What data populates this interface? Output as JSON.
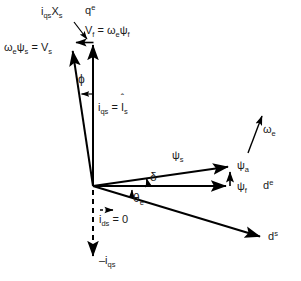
{
  "figure": {
    "type": "phasor-vector-diagram",
    "title": "",
    "background_color": "#ffffff",
    "line_color": "#000000",
    "text_color": "#1a1a1a",
    "width": 301,
    "height": 281
  },
  "labels": {
    "iqs_xs": "i",
    "iqs_xs_sub1": "qs",
    "iqs_xs_main2": "X",
    "iqs_xs_sub2": "s",
    "qe_axis": "q",
    "qe_axis_sup": "e",
    "vf_pre": "V",
    "vf_sub": "f",
    "vf_eq": " = ",
    "vf_omega": "ω",
    "vf_omega_sub": "e",
    "vf_psi": "ψ",
    "vf_psi_sub": "f",
    "vs_omega": "ω",
    "vs_omega_sub": "e",
    "vs_psi": "ψ",
    "vs_psi_sub": "s",
    "vs_eq": " = V",
    "vs_sub": "s",
    "phi": "ϕ",
    "iqs_eq_pre": "i",
    "iqs_eq_sub": "qs",
    "iqs_eq_mid": " = ",
    "iqs_eq_I": "I",
    "iqs_eq_I_sub": "s",
    "iqs_eq_hat": "ˆ",
    "omega_e": "ω",
    "omega_e_sub": "e",
    "psi_s": "ψ",
    "psi_s_sub": "s",
    "psi_a": "ψ",
    "psi_a_sub": "a",
    "psi_f": "ψ",
    "psi_f_sub": "f",
    "de_axis": "d",
    "de_axis_sup": "e",
    "delta": "δ",
    "theta_e": "θ",
    "theta_e_sub": "e",
    "ids_pre": "i",
    "ids_sub": "ds",
    "ids_eq": " = 0",
    "neg_iqs_pre": "–i",
    "neg_iqs_sub": "qs",
    "ds_axis": "d",
    "ds_axis_sup": "s"
  },
  "geometry": {
    "origin": {
      "x": 93,
      "y": 186
    },
    "vectors": [
      {
        "name": "qe-axis-vertical",
        "x1": 93,
        "y1": 186,
        "x2": 93,
        "y2": 42,
        "arrow": true
      },
      {
        "name": "vs-vector",
        "x1": 93,
        "y1": 186,
        "x2": 72,
        "y2": 48,
        "arrow": true
      },
      {
        "name": "iqs-xs-component",
        "x1": 93,
        "y1": 42,
        "x2": 73,
        "y2": 42,
        "arrow": true
      },
      {
        "name": "psi-s-vector",
        "x1": 93,
        "y1": 186,
        "x2": 231,
        "y2": 166,
        "arrow": true
      },
      {
        "name": "psi-f-vector",
        "x1": 93,
        "y1": 186,
        "x2": 229,
        "y2": 186,
        "arrow": true
      },
      {
        "name": "psi-a-vector",
        "x1": 230,
        "y1": 186,
        "x2": 230,
        "y2": 169,
        "arrow": true
      },
      {
        "name": "ds-axis",
        "x1": 93,
        "y1": 186,
        "x2": 265,
        "y2": 238,
        "arrow": true
      },
      {
        "name": "neg-iqs-dashed-axis",
        "x1": 93,
        "y1": 189,
        "x2": 93,
        "y2": 262,
        "arrow": true,
        "dashed": true
      },
      {
        "name": "omega-e-arrow",
        "x1": 247,
        "y1": 152,
        "x2": 263,
        "y2": 112,
        "arrow": true
      },
      {
        "name": "ids-zero-arrow",
        "x1": 101,
        "y1": 210,
        "x2": 117,
        "y2": 210,
        "arrow": true,
        "dashed": true
      }
    ],
    "angles": [
      {
        "name": "phi",
        "label": "ϕ",
        "vertex": "between Vs vector and qe axis"
      },
      {
        "name": "delta",
        "label": "δ",
        "vertex": "between psi_s and psi_f"
      },
      {
        "name": "theta_e",
        "label": "θe",
        "vertex": "between psi_f and ds axis"
      }
    ]
  }
}
